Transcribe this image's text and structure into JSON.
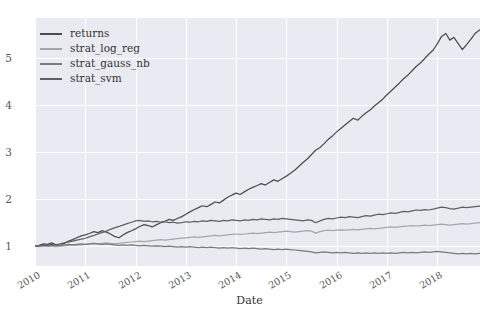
{
  "chart_data": {
    "type": "line",
    "title": "",
    "xlabel": "Date",
    "ylabel": "",
    "grid": true,
    "legend_position": "upper left",
    "xlim": [
      2010.0,
      2018.85
    ],
    "ylim": [
      0.58,
      5.85
    ],
    "yticks": [
      1,
      2,
      3,
      4,
      5
    ],
    "ytick_labels": [
      "1",
      "2",
      "3",
      "4",
      "5"
    ],
    "xticks": [
      2010,
      2011,
      2012,
      2013,
      2014,
      2015,
      2016,
      2017,
      2018
    ],
    "xtick_labels": [
      "2010",
      "2011",
      "2012",
      "2013",
      "2014",
      "2015",
      "2016",
      "2017",
      "2018"
    ],
    "colors": {
      "returns": "#4c4c4c",
      "strat_log_reg": "#a6a6a6",
      "strat_gauss_nb": "#7a7a7a",
      "strat_svm": "#5f5f5f",
      "axes_background": "#eaeaf2",
      "gridline": "#ffffff",
      "tick_text": "#555555"
    },
    "x": [
      2010.0,
      2010.08,
      2010.17,
      2010.25,
      2010.33,
      2010.42,
      2010.5,
      2010.58,
      2010.67,
      2010.75,
      2010.83,
      2010.92,
      2011.0,
      2011.08,
      2011.17,
      2011.25,
      2011.33,
      2011.42,
      2011.5,
      2011.58,
      2011.67,
      2011.75,
      2011.83,
      2011.92,
      2012.0,
      2012.08,
      2012.17,
      2012.25,
      2012.33,
      2012.42,
      2012.5,
      2012.58,
      2012.67,
      2012.75,
      2012.83,
      2012.92,
      2013.0,
      2013.08,
      2013.17,
      2013.25,
      2013.33,
      2013.42,
      2013.5,
      2013.58,
      2013.67,
      2013.75,
      2013.83,
      2013.92,
      2014.0,
      2014.08,
      2014.17,
      2014.25,
      2014.33,
      2014.42,
      2014.5,
      2014.58,
      2014.67,
      2014.75,
      2014.83,
      2014.92,
      2015.0,
      2015.08,
      2015.17,
      2015.25,
      2015.33,
      2015.42,
      2015.5,
      2015.58,
      2015.67,
      2015.75,
      2015.83,
      2015.92,
      2016.0,
      2016.08,
      2016.17,
      2016.25,
      2016.33,
      2016.42,
      2016.5,
      2016.58,
      2016.67,
      2016.75,
      2016.83,
      2016.92,
      2017.0,
      2017.08,
      2017.17,
      2017.25,
      2017.33,
      2017.42,
      2017.5,
      2017.58,
      2017.67,
      2017.75,
      2017.83,
      2017.92,
      2018.0,
      2018.08,
      2018.17,
      2018.25,
      2018.33,
      2018.42,
      2018.5,
      2018.58,
      2018.67,
      2018.75,
      2018.85
    ],
    "series": [
      {
        "name": "returns",
        "color": "#4c4c4c",
        "final_value": 5.6,
        "peak_value": 5.72,
        "values": [
          1.0,
          1.02,
          1.05,
          1.04,
          1.07,
          1.03,
          1.01,
          1.06,
          1.11,
          1.14,
          1.18,
          1.22,
          1.24,
          1.27,
          1.31,
          1.29,
          1.33,
          1.3,
          1.26,
          1.21,
          1.18,
          1.24,
          1.29,
          1.33,
          1.37,
          1.42,
          1.46,
          1.44,
          1.41,
          1.46,
          1.5,
          1.53,
          1.57,
          1.55,
          1.59,
          1.63,
          1.68,
          1.73,
          1.78,
          1.82,
          1.86,
          1.84,
          1.89,
          1.94,
          1.92,
          1.98,
          2.04,
          2.09,
          2.13,
          2.1,
          2.16,
          2.21,
          2.25,
          2.29,
          2.33,
          2.3,
          2.36,
          2.41,
          2.38,
          2.44,
          2.49,
          2.55,
          2.62,
          2.7,
          2.78,
          2.86,
          2.95,
          3.04,
          3.1,
          3.18,
          3.27,
          3.35,
          3.43,
          3.5,
          3.58,
          3.65,
          3.72,
          3.68,
          3.76,
          3.83,
          3.9,
          3.98,
          4.05,
          4.13,
          4.22,
          4.3,
          4.39,
          4.47,
          4.56,
          4.64,
          4.73,
          4.82,
          4.9,
          4.99,
          5.08,
          5.17,
          5.3,
          5.45,
          5.52,
          5.38,
          5.44,
          5.3,
          5.18,
          5.28,
          5.4,
          5.52,
          5.6
        ]
      },
      {
        "name": "strat_log_reg",
        "color": "#a6a6a6",
        "final_value": 1.5,
        "values": [
          1.0,
          0.99,
          1.0,
          1.01,
          1.0,
          0.99,
          1.0,
          1.01,
          1.02,
          1.03,
          1.02,
          1.03,
          1.04,
          1.05,
          1.06,
          1.05,
          1.06,
          1.07,
          1.06,
          1.05,
          1.06,
          1.07,
          1.08,
          1.09,
          1.1,
          1.11,
          1.1,
          1.11,
          1.12,
          1.13,
          1.14,
          1.13,
          1.14,
          1.15,
          1.16,
          1.17,
          1.18,
          1.19,
          1.2,
          1.19,
          1.2,
          1.21,
          1.22,
          1.23,
          1.22,
          1.23,
          1.24,
          1.25,
          1.26,
          1.25,
          1.26,
          1.27,
          1.28,
          1.27,
          1.28,
          1.29,
          1.3,
          1.29,
          1.3,
          1.31,
          1.32,
          1.31,
          1.3,
          1.31,
          1.32,
          1.33,
          1.32,
          1.28,
          1.31,
          1.33,
          1.34,
          1.33,
          1.34,
          1.35,
          1.34,
          1.35,
          1.36,
          1.35,
          1.36,
          1.37,
          1.38,
          1.37,
          1.38,
          1.39,
          1.4,
          1.41,
          1.4,
          1.41,
          1.42,
          1.43,
          1.44,
          1.43,
          1.44,
          1.45,
          1.44,
          1.45,
          1.46,
          1.47,
          1.46,
          1.45,
          1.46,
          1.47,
          1.48,
          1.47,
          1.48,
          1.49,
          1.5
        ]
      },
      {
        "name": "strat_gauss_nb",
        "color": "#7a7a7a",
        "final_value": 0.85,
        "peak_value": 1.06,
        "values": [
          1.0,
          1.01,
          1.02,
          1.01,
          1.02,
          1.03,
          1.02,
          1.03,
          1.04,
          1.03,
          1.04,
          1.05,
          1.04,
          1.05,
          1.06,
          1.05,
          1.04,
          1.05,
          1.04,
          1.03,
          1.02,
          1.03,
          1.02,
          1.03,
          1.02,
          1.01,
          1.02,
          1.01,
          1.0,
          1.01,
          1.0,
          0.99,
          1.0,
          0.99,
          0.98,
          0.99,
          0.98,
          0.99,
          0.98,
          0.97,
          0.98,
          0.97,
          0.98,
          0.97,
          0.96,
          0.97,
          0.96,
          0.97,
          0.96,
          0.95,
          0.96,
          0.95,
          0.96,
          0.95,
          0.94,
          0.95,
          0.94,
          0.93,
          0.94,
          0.93,
          0.94,
          0.93,
          0.92,
          0.91,
          0.9,
          0.89,
          0.88,
          0.86,
          0.87,
          0.88,
          0.87,
          0.86,
          0.87,
          0.86,
          0.87,
          0.86,
          0.85,
          0.86,
          0.85,
          0.86,
          0.85,
          0.86,
          0.85,
          0.86,
          0.85,
          0.86,
          0.85,
          0.86,
          0.87,
          0.86,
          0.87,
          0.86,
          0.87,
          0.88,
          0.87,
          0.88,
          0.89,
          0.88,
          0.87,
          0.86,
          0.85,
          0.84,
          0.85,
          0.84,
          0.85,
          0.84,
          0.85
        ]
      },
      {
        "name": "strat_svm",
        "color": "#5f5f5f",
        "final_value": 1.85,
        "values": [
          1.0,
          1.01,
          1.03,
          1.02,
          1.04,
          1.03,
          1.05,
          1.07,
          1.09,
          1.11,
          1.13,
          1.15,
          1.17,
          1.2,
          1.23,
          1.26,
          1.29,
          1.32,
          1.36,
          1.39,
          1.42,
          1.45,
          1.48,
          1.51,
          1.54,
          1.55,
          1.53,
          1.54,
          1.52,
          1.53,
          1.51,
          1.52,
          1.5,
          1.51,
          1.49,
          1.5,
          1.52,
          1.51,
          1.53,
          1.52,
          1.54,
          1.53,
          1.55,
          1.54,
          1.53,
          1.55,
          1.54,
          1.56,
          1.55,
          1.54,
          1.56,
          1.55,
          1.57,
          1.56,
          1.58,
          1.57,
          1.56,
          1.58,
          1.57,
          1.59,
          1.58,
          1.57,
          1.56,
          1.55,
          1.54,
          1.56,
          1.55,
          1.5,
          1.54,
          1.57,
          1.59,
          1.58,
          1.6,
          1.62,
          1.61,
          1.63,
          1.62,
          1.61,
          1.63,
          1.65,
          1.64,
          1.66,
          1.68,
          1.67,
          1.69,
          1.71,
          1.7,
          1.72,
          1.74,
          1.73,
          1.75,
          1.77,
          1.76,
          1.78,
          1.77,
          1.79,
          1.81,
          1.83,
          1.82,
          1.8,
          1.79,
          1.81,
          1.83,
          1.82,
          1.83,
          1.84,
          1.85
        ]
      }
    ]
  },
  "legend": {
    "items": [
      {
        "label": "returns"
      },
      {
        "label": "strat_log_reg"
      },
      {
        "label": "strat_gauss_nb"
      },
      {
        "label": "strat_svm"
      }
    ]
  }
}
